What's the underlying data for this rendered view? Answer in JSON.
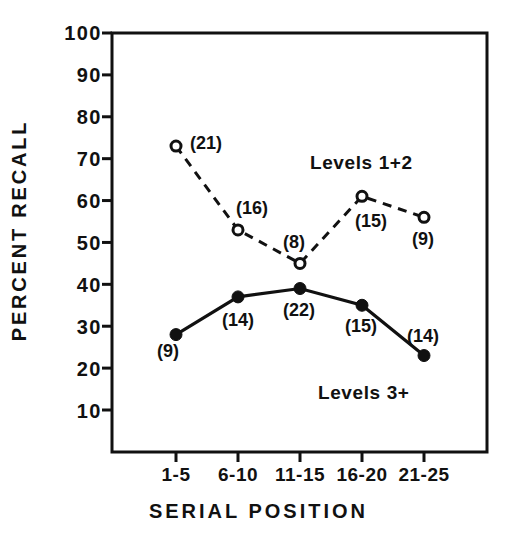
{
  "chart_data": {
    "type": "line",
    "title": "",
    "xlabel": "SERIAL POSITION",
    "ylabel": "PERCENT RECALL",
    "categories": [
      "1-5",
      "6-10",
      "11-15",
      "16-20",
      "21-25"
    ],
    "ylim": [
      0,
      100
    ],
    "yticks": [
      "100",
      "90",
      "80",
      "70",
      "60",
      "50",
      "40",
      "30",
      "20",
      "10"
    ],
    "ytick_values": [
      100,
      90,
      80,
      70,
      60,
      50,
      40,
      30,
      20,
      10
    ],
    "grid": false,
    "legend_position": "inline-annotation",
    "series": [
      {
        "name": "Levels 1+2",
        "values": [
          73,
          53,
          45,
          61,
          56
        ],
        "point_labels": [
          "(21)",
          "(16)",
          "(8)",
          "(15)",
          "(9)"
        ],
        "counts": [
          21,
          16,
          8,
          15,
          9
        ],
        "line_style": "dashed",
        "marker": "open-circle",
        "color": "#111111"
      },
      {
        "name": "Levels 3+",
        "values": [
          28,
          37,
          39,
          35,
          23
        ],
        "point_labels": [
          "(9)",
          "(14)",
          "(22)",
          "(15)",
          "(14)"
        ],
        "counts": [
          9,
          14,
          22,
          15,
          14
        ],
        "line_style": "solid",
        "marker": "filled-circle",
        "color": "#111111"
      }
    ],
    "annotations": [
      {
        "text": "Levels 1+2",
        "x": 0.66,
        "y": 66
      },
      {
        "text": "Levels 3+",
        "x": 0.72,
        "y": 16
      }
    ]
  },
  "colors": {
    "ink": "#111111",
    "background": "#ffffff"
  }
}
